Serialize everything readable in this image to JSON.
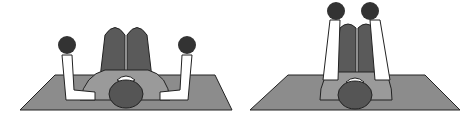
{
  "figure": {
    "panels": [
      {
        "name": "start-position",
        "description": "Lying on mat, arms bent with dumbbells at sides, knees bent up"
      },
      {
        "name": "end-position",
        "description": "Lying on mat, arms extended upward holding dumbbells together, knees bent up"
      }
    ]
  },
  "colors": {
    "background": "#ffffff",
    "mat": "#8c8c8c",
    "legs": "#5a5a5a",
    "torso": "#9a9a9a",
    "head": "#555555",
    "arm": "#ffffff",
    "dumbbell": "#333333",
    "outline": "#222222"
  }
}
